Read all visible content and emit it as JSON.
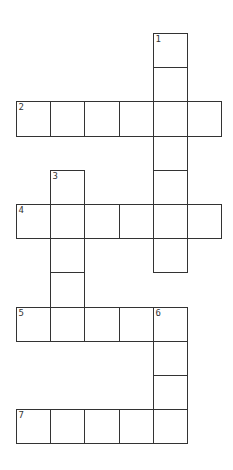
{
  "puzzle": {
    "origin": {
      "x": 16,
      "y": 33
    },
    "cell_size": 34.2,
    "colors": {
      "border": "#333333",
      "cell": "#ffffff",
      "number": "#333333",
      "background": "#ffffff"
    },
    "words": [
      {
        "number": "1",
        "direction": "down",
        "col": 4,
        "row": 0,
        "length": 7
      },
      {
        "number": "2",
        "direction": "across",
        "col": 0,
        "row": 2,
        "length": 6
      },
      {
        "number": "3",
        "direction": "down",
        "col": 1,
        "row": 4,
        "length": 5
      },
      {
        "number": "4",
        "direction": "across",
        "col": 0,
        "row": 5,
        "length": 6
      },
      {
        "number": "5",
        "direction": "across",
        "col": 0,
        "row": 8,
        "length": 5
      },
      {
        "number": "6",
        "direction": "down",
        "col": 4,
        "row": 8,
        "length": 4
      },
      {
        "number": "7",
        "direction": "across",
        "col": 0,
        "row": 11,
        "length": 5
      }
    ]
  }
}
